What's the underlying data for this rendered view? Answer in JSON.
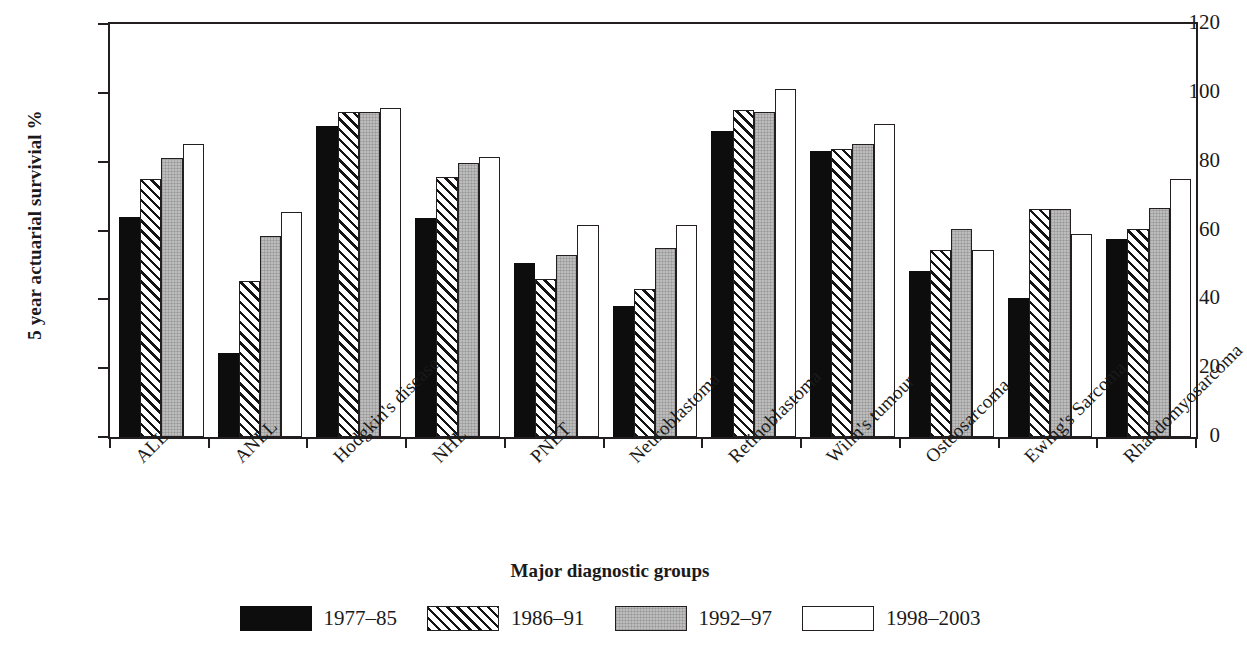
{
  "chart_data": {
    "type": "bar",
    "title": "",
    "xlabel": "Major diagnostic groups",
    "ylabel": "5 year actuarial survivial %",
    "ylim": [
      0,
      120
    ],
    "yticks": [
      0,
      20,
      40,
      60,
      80,
      100,
      120
    ],
    "grid": false,
    "legend_position": "bottom",
    "categories": [
      "ALL",
      "ANLL",
      "Hodgkin's disease",
      "NHL",
      "PNET",
      "Neuroblastoma",
      "Retinoblastoma",
      "Wilm's tumour",
      "Osteosarcoma",
      "Ewing's Sarcoma",
      "Rhabdomyosarcoma"
    ],
    "series": [
      {
        "name": "1977–85",
        "fill": "solid-black",
        "color": "#0d0d0d",
        "values": [
          64.0,
          24.3,
          90.5,
          63.5,
          50.6,
          38.0,
          89.0,
          83.0,
          48.2,
          40.3,
          57.5
        ]
      },
      {
        "name": "1986–91",
        "fill": "diagonal-hatch",
        "color": "#ffffff",
        "values": [
          75.0,
          45.3,
          94.5,
          75.5,
          46.0,
          43.0,
          95.0,
          83.8,
          54.2,
          66.3,
          60.5
        ]
      },
      {
        "name": "1992–97",
        "fill": "gray",
        "color": "#bdbdbd",
        "values": [
          81.0,
          58.3,
          94.4,
          79.6,
          52.8,
          54.8,
          94.3,
          85.0,
          60.3,
          66.3,
          66.5
        ]
      },
      {
        "name": "1998–2003",
        "fill": "white",
        "color": "#ffffff",
        "values": [
          85.0,
          65.3,
          95.6,
          81.5,
          61.5,
          61.5,
          101.0,
          91.0,
          54.2,
          59.0,
          75.0
        ]
      }
    ]
  },
  "axes": {
    "y_title": "5 year actuarial survivial %",
    "x_title": "Major diagnostic groups",
    "y_tick_labels": [
      "120",
      "100",
      "80",
      "60",
      "40",
      "20",
      "0"
    ]
  },
  "legend": {
    "items": [
      {
        "label": "1977–85",
        "swatch": "solid-black-swatch"
      },
      {
        "label": "1986–91",
        "swatch": "diagonal-hatch-swatch"
      },
      {
        "label": "1992–97",
        "swatch": "gray-swatch"
      },
      {
        "label": "1998–2003",
        "swatch": "white-swatch"
      }
    ]
  }
}
